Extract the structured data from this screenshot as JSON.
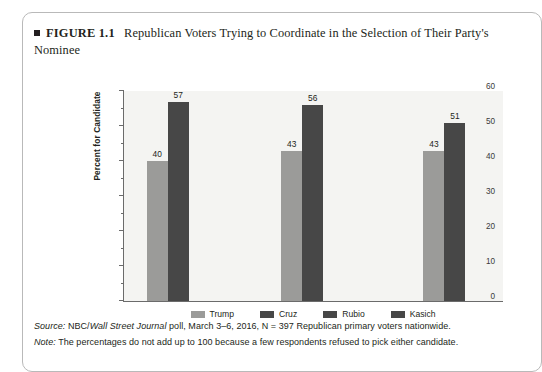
{
  "figure": {
    "bullet_icon": "filled-square-icon",
    "label": "FIGURE 1.1",
    "title": "Republican Voters Trying to Coordinate in the Selection of Their Party's Nominee"
  },
  "footnotes": {
    "source_keyword": "Source:",
    "source_pre": " NBC/",
    "source_italic": "Wall Street Journal",
    "source_post": " poll, March 3–6, 2016, N = 397 Republican primary voters nationwide.",
    "note_keyword": "Note:",
    "note_text": " The percentages do not add up to 100 because a few respondents refused to pick either candidate."
  },
  "colors": {
    "light_bar": "#9b9b99",
    "dark_bar": "#474747",
    "plot_background": "#f4f4f2",
    "axis": "#6b6b6b",
    "text": "#231f20"
  },
  "chart_data": {
    "type": "bar",
    "title": "Republican Voters Trying to Coordinate in the Selection of Their Party's Nominee",
    "xlabel": "",
    "ylabel": "Percent for Candidate",
    "ylim": [
      0,
      60
    ],
    "yticks": [
      0,
      10,
      20,
      30,
      40,
      50,
      60
    ],
    "ytick_labels": [
      "0",
      "10",
      "20",
      "30",
      "40",
      "50",
      "60"
    ],
    "minor_tick_step": 5,
    "grid": false,
    "legend_position": "bottom",
    "legend": [
      {
        "name": "Trump",
        "color": "#9b9b99"
      },
      {
        "name": "Cruz",
        "color": "#474747"
      },
      {
        "name": "Rubio",
        "color": "#474747"
      },
      {
        "name": "Kasich",
        "color": "#474747"
      }
    ],
    "categories": [
      "Trump vs. Cruz",
      "Trump vs. Rubio",
      "Trump vs. Kasich"
    ],
    "category_labels_visible": false,
    "groups": [
      {
        "matchup": "Trump vs. Cruz",
        "bars": [
          {
            "name": "Trump",
            "value": 40,
            "style": "light"
          },
          {
            "name": "Cruz",
            "value": 57,
            "style": "dark"
          }
        ]
      },
      {
        "matchup": "Trump vs. Rubio",
        "bars": [
          {
            "name": "Trump",
            "value": 43,
            "style": "light"
          },
          {
            "name": "Rubio",
            "value": 56,
            "style": "dark"
          }
        ]
      },
      {
        "matchup": "Trump vs. Kasich",
        "bars": [
          {
            "name": "Trump",
            "value": 43,
            "style": "light"
          },
          {
            "name": "Kasich",
            "value": 51,
            "style": "dark"
          }
        ]
      }
    ]
  }
}
